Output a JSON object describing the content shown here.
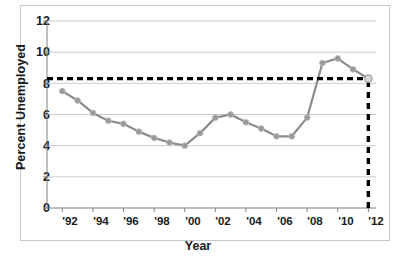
{
  "chart_data": {
    "type": "line",
    "title": "",
    "xlabel": "Year",
    "ylabel": "Percent Unemployed",
    "xlim": [
      1991,
      2012.5
    ],
    "ylim": [
      0,
      12
    ],
    "grid": true,
    "legend": "none",
    "y_ticks": [
      0,
      2,
      4,
      6,
      8,
      10,
      12
    ],
    "y_tick_labels": [
      "0",
      "2",
      "4",
      "6",
      "8",
      "10",
      "12"
    ],
    "x_ticks": [
      1992,
      1994,
      1996,
      1998,
      2000,
      2002,
      2004,
      2006,
      2008,
      2010,
      2012
    ],
    "x_tick_labels": [
      "'92",
      "'94",
      "'96",
      "'98",
      "'00",
      "'02",
      "'04",
      "'06",
      "'08",
      "'10",
      "'12"
    ],
    "series": [
      {
        "name": "Percent Unemployed",
        "color": "#8c8c8c",
        "marker": "circle",
        "x": [
          1992,
          1993,
          1994,
          1995,
          1996,
          1997,
          1998,
          1999,
          2000,
          2001,
          2002,
          2003,
          2004,
          2005,
          2006,
          2007,
          2008,
          2009,
          2010,
          2011,
          2012
        ],
        "values": [
          7.5,
          6.9,
          6.1,
          5.6,
          5.4,
          4.9,
          4.5,
          4.2,
          4.0,
          4.8,
          5.8,
          6.0,
          5.5,
          5.1,
          4.6,
          4.6,
          5.8,
          9.3,
          9.6,
          8.9,
          8.3
        ]
      }
    ],
    "annotations": [
      {
        "name": "reference-line-horizontal",
        "type": "hline",
        "value": 8.3,
        "style": "dashed",
        "color": "#000000"
      },
      {
        "name": "reference-line-vertical",
        "type": "vline",
        "value": 2012,
        "style": "dashed",
        "color": "#000000"
      },
      {
        "name": "endpoint-marker",
        "type": "point",
        "x": 2012,
        "y": 8.3,
        "style": "open-circle",
        "color": "#a6a6a6"
      }
    ]
  },
  "axes": {
    "ylabel": "Percent Unemployed",
    "xlabel": "Year",
    "y_tick_labels": [
      "12",
      "10",
      "8",
      "6",
      "4",
      "2",
      "0"
    ],
    "x_tick_labels": [
      "'92",
      "'94",
      "'96",
      "'98",
      "'00",
      "'02",
      "'04",
      "'06",
      "'08",
      "'10",
      "'12"
    ]
  },
  "colors": {
    "line": "#8c8c8c",
    "marker": "#999999",
    "grid": "#bfbfbf",
    "axis": "#808080",
    "dashed": "#000000",
    "text": "#1a1a1a",
    "frame": "#c8c8c8"
  }
}
